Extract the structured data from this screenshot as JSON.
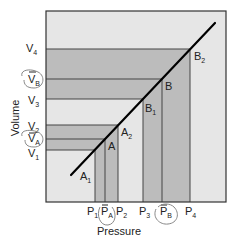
{
  "diagram": {
    "x_axis_label": "Pressure",
    "y_axis_label": "Volume",
    "colors": {
      "background": "#e6e6e6",
      "band": "#bcbcbc",
      "line": "#333333",
      "curve": "#000000",
      "circle": "#888888"
    },
    "x_ticks": [
      {
        "main": "P",
        "sub": "1",
        "bar": false,
        "circled": false
      },
      {
        "main": "P",
        "sub": "A",
        "bar": true,
        "circled": true
      },
      {
        "main": "P",
        "sub": "2",
        "bar": false,
        "circled": false
      },
      {
        "main": "P",
        "sub": "3",
        "bar": false,
        "circled": false
      },
      {
        "main": "P",
        "sub": "B",
        "bar": true,
        "circled": true
      },
      {
        "main": "P",
        "sub": "4",
        "bar": false,
        "circled": false
      }
    ],
    "y_ticks": [
      {
        "main": "V",
        "sub": "4",
        "bar": false,
        "circled": false
      },
      {
        "main": "V",
        "sub": "B",
        "bar": true,
        "circled": true
      },
      {
        "main": "V",
        "sub": "3",
        "bar": false,
        "circled": false
      },
      {
        "main": "V",
        "sub": "2",
        "bar": false,
        "circled": false
      },
      {
        "main": "V",
        "sub": "A",
        "bar": true,
        "circled": true
      },
      {
        "main": "V",
        "sub": "1",
        "bar": false,
        "circled": false
      }
    ],
    "points": [
      {
        "main": "A",
        "sub": "1"
      },
      {
        "main": "A",
        "sub": ""
      },
      {
        "main": "A",
        "sub": "2"
      },
      {
        "main": "B",
        "sub": "1"
      },
      {
        "main": "B",
        "sub": ""
      },
      {
        "main": "B",
        "sub": "2"
      }
    ]
  }
}
